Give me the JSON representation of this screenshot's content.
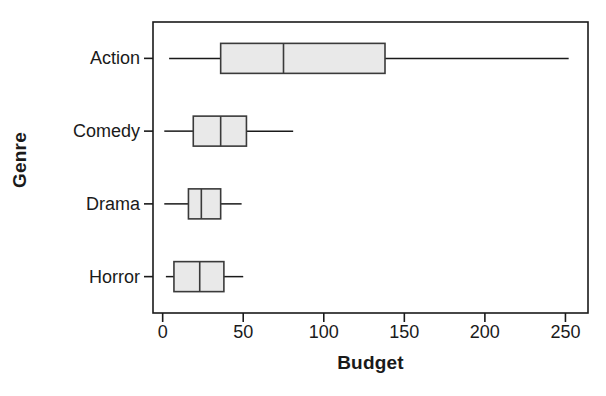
{
  "chart_data": {
    "type": "box",
    "title": "",
    "xlabel": "Budget",
    "ylabel": "Genre",
    "orientation": "horizontal",
    "grid": false,
    "legend": false,
    "xlim": [
      -6,
      264
    ],
    "xticks": [
      0,
      50,
      100,
      150,
      200,
      250
    ],
    "xtick_labels": [
      "0",
      "50",
      "100",
      "150",
      "200",
      "250"
    ],
    "categories": [
      "Action",
      "Comedy",
      "Drama",
      "Horror"
    ],
    "boxes": [
      {
        "category": "Action",
        "whisker_low": 4,
        "q1": 36,
        "median": 75,
        "q3": 138,
        "whisker_high": 252
      },
      {
        "category": "Comedy",
        "whisker_low": 1,
        "q1": 19,
        "median": 36,
        "q3": 52,
        "whisker_high": 81
      },
      {
        "category": "Drama",
        "whisker_low": 1,
        "q1": 16,
        "median": 24,
        "q3": 36,
        "whisker_high": 49
      },
      {
        "category": "Horror",
        "whisker_low": 2,
        "q1": 7,
        "median": 23,
        "q3": 38,
        "whisker_high": 50
      }
    ],
    "colors": {
      "box_fill": "#e9e9e9",
      "box_stroke": "#3a3a3a",
      "axis": "#1a1a1a",
      "background": "#ffffff"
    }
  }
}
